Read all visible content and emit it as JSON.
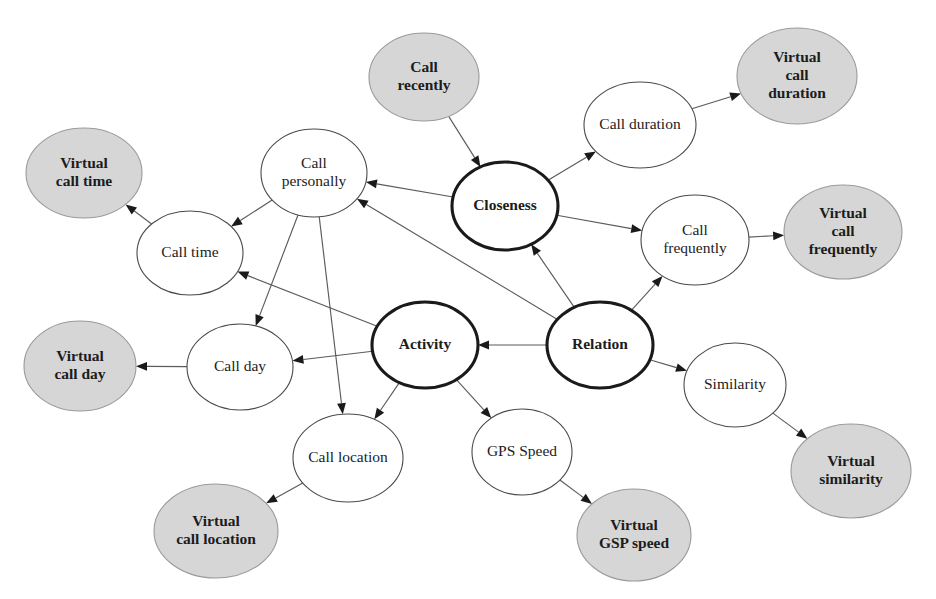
{
  "diagram": {
    "type": "directed-graph",
    "canvas": {
      "width": 936,
      "height": 599
    },
    "styles": {
      "plain_fill": "#ffffff",
      "plain_stroke": "#4a4a4a",
      "shaded_fill": "#d6d6d6",
      "shaded_stroke": "#9a9a9a",
      "bold_stroke": "#1a1a1a",
      "edge_color": "#5b5b5b",
      "text_color": "#1c1c1c"
    },
    "nodes": [
      {
        "id": "call_recently",
        "label": "Call recently",
        "lines": [
          "Call",
          "recently"
        ],
        "cx": 424,
        "cy": 77,
        "rx": 55,
        "ry": 44,
        "style": "shaded",
        "bold_text": true
      },
      {
        "id": "call_duration",
        "label": "Call duration",
        "lines": [
          "Call duration"
        ],
        "cx": 640,
        "cy": 125,
        "rx": 56,
        "ry": 43,
        "style": "plain",
        "bold_text": false
      },
      {
        "id": "virtual_call_duration",
        "label": "Virtual call duration",
        "lines": [
          "Virtual",
          "call",
          "duration"
        ],
        "cx": 797,
        "cy": 76,
        "rx": 60,
        "ry": 48,
        "style": "shaded",
        "bold_text": true
      },
      {
        "id": "virtual_call_time",
        "label": "Virtual call time",
        "lines": [
          "Virtual",
          "call time"
        ],
        "cx": 84,
        "cy": 173,
        "rx": 58,
        "ry": 45,
        "style": "shaded",
        "bold_text": true
      },
      {
        "id": "call_personally",
        "label": "Call personally",
        "lines": [
          "Call",
          "personally"
        ],
        "cx": 314,
        "cy": 173,
        "rx": 53,
        "ry": 44,
        "style": "plain",
        "bold_text": false
      },
      {
        "id": "closeness",
        "label": "Closeness",
        "lines": [
          "Closeness"
        ],
        "cx": 505,
        "cy": 206,
        "rx": 53,
        "ry": 44,
        "style": "bold",
        "bold_text": true
      },
      {
        "id": "call_frequently",
        "label": "Call frequently",
        "lines": [
          "Call",
          "frequently"
        ],
        "cx": 695,
        "cy": 240,
        "rx": 54,
        "ry": 45,
        "style": "plain",
        "bold_text": false
      },
      {
        "id": "virtual_call_frequently",
        "label": "Virtual call frequently",
        "lines": [
          "Virtual",
          "call",
          "frequently"
        ],
        "cx": 843,
        "cy": 232,
        "rx": 59,
        "ry": 47,
        "style": "shaded",
        "bold_text": true
      },
      {
        "id": "call_time",
        "label": "Call time",
        "lines": [
          "Call time"
        ],
        "cx": 190,
        "cy": 253,
        "rx": 53,
        "ry": 42,
        "style": "plain",
        "bold_text": false
      },
      {
        "id": "activity",
        "label": "Activity",
        "lines": [
          "Activity"
        ],
        "cx": 425,
        "cy": 345,
        "rx": 53,
        "ry": 43,
        "style": "bold",
        "bold_text": true
      },
      {
        "id": "relation",
        "label": "Relation",
        "lines": [
          "Relation"
        ],
        "cx": 600,
        "cy": 345,
        "rx": 53,
        "ry": 43,
        "style": "bold",
        "bold_text": true
      },
      {
        "id": "similarity",
        "label": "Similarity",
        "lines": [
          "Similarity"
        ],
        "cx": 735,
        "cy": 385,
        "rx": 51,
        "ry": 42,
        "style": "plain",
        "bold_text": false
      },
      {
        "id": "virtual_call_day",
        "label": "Virtual call day",
        "lines": [
          "Virtual",
          "call day"
        ],
        "cx": 80,
        "cy": 366,
        "rx": 56,
        "ry": 45,
        "style": "shaded",
        "bold_text": true
      },
      {
        "id": "call_day",
        "label": "Call day",
        "lines": [
          "Call day"
        ],
        "cx": 240,
        "cy": 367,
        "rx": 53,
        "ry": 43,
        "style": "plain",
        "bold_text": false
      },
      {
        "id": "call_location",
        "label": "Call location",
        "lines": [
          "Call location"
        ],
        "cx": 348,
        "cy": 458,
        "rx": 55,
        "ry": 44,
        "style": "plain",
        "bold_text": false
      },
      {
        "id": "gps_speed",
        "label": "GPS Speed",
        "lines": [
          "GPS Speed"
        ],
        "cx": 522,
        "cy": 452,
        "rx": 50,
        "ry": 43,
        "style": "plain",
        "bold_text": false
      },
      {
        "id": "virtual_similarity",
        "label": "Virtual similarity",
        "lines": [
          "Virtual",
          "similarity"
        ],
        "cx": 851,
        "cy": 471,
        "rx": 60,
        "ry": 47,
        "style": "shaded",
        "bold_text": true
      },
      {
        "id": "virtual_call_location",
        "label": "Virtual call location",
        "lines": [
          "Virtual",
          "call location"
        ],
        "cx": 216,
        "cy": 531,
        "rx": 62,
        "ry": 47,
        "style": "shaded",
        "bold_text": true
      },
      {
        "id": "virtual_gsp_speed",
        "label": "Virtual GSP speed",
        "lines": [
          "Virtual",
          "GSP speed"
        ],
        "cx": 634,
        "cy": 535,
        "rx": 57,
        "ry": 46,
        "style": "shaded",
        "bold_text": true
      }
    ],
    "edges": [
      {
        "from": "call_recently",
        "to": "closeness"
      },
      {
        "from": "closeness",
        "to": "call_duration"
      },
      {
        "from": "closeness",
        "to": "call_frequently"
      },
      {
        "from": "closeness",
        "to": "call_personally"
      },
      {
        "from": "call_duration",
        "to": "virtual_call_duration"
      },
      {
        "from": "call_frequently",
        "to": "virtual_call_frequently"
      },
      {
        "from": "relation",
        "to": "closeness"
      },
      {
        "from": "relation",
        "to": "activity"
      },
      {
        "from": "relation",
        "to": "call_personally"
      },
      {
        "from": "relation",
        "to": "call_frequently"
      },
      {
        "from": "relation",
        "to": "similarity"
      },
      {
        "from": "similarity",
        "to": "virtual_similarity"
      },
      {
        "from": "call_personally",
        "to": "call_time"
      },
      {
        "from": "call_personally",
        "to": "call_day"
      },
      {
        "from": "call_personally",
        "to": "call_location"
      },
      {
        "from": "call_time",
        "to": "virtual_call_time"
      },
      {
        "from": "call_day",
        "to": "virtual_call_day"
      },
      {
        "from": "activity",
        "to": "call_time"
      },
      {
        "from": "activity",
        "to": "call_day"
      },
      {
        "from": "activity",
        "to": "call_location"
      },
      {
        "from": "activity",
        "to": "gps_speed"
      },
      {
        "from": "call_location",
        "to": "virtual_call_location"
      },
      {
        "from": "gps_speed",
        "to": "virtual_gsp_speed"
      }
    ]
  }
}
